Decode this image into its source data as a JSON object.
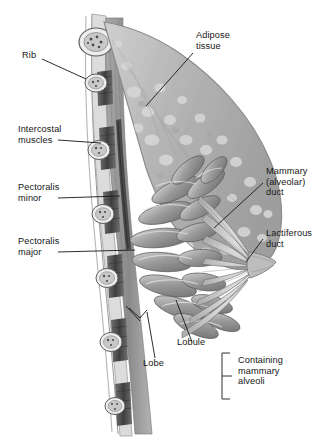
{
  "figure": {
    "type": "anatomical-illustration",
    "style": "grayscale medical line drawing",
    "width": 336,
    "height": 439,
    "background": "#ffffff"
  },
  "labels": [
    {
      "id": "rib",
      "text": "Rib",
      "x": 22,
      "y": 55,
      "leader": true
    },
    {
      "id": "adipose",
      "text": "Adipose\ntissue",
      "x": 196,
      "y": 36,
      "leader": true
    },
    {
      "id": "intercostal",
      "text": "Intercostal\nmuscles",
      "x": 18,
      "y": 124,
      "leader": true
    },
    {
      "id": "pect-minor",
      "text": "Pectoralis\nminor",
      "x": 18,
      "y": 182,
      "leader": true
    },
    {
      "id": "pect-major",
      "text": "Pectoralis\nmajor",
      "x": 18,
      "y": 236,
      "leader": true
    },
    {
      "id": "mammary-duct",
      "text": "Mammary\n(alveolar)\nduct",
      "x": 266,
      "y": 170,
      "leader": true
    },
    {
      "id": "lactiferous",
      "text": "Lactiferous\nduct",
      "x": 266,
      "y": 228,
      "leader": true
    },
    {
      "id": "lobe",
      "text": "Lobe",
      "x": 143,
      "y": 363,
      "leader": true
    },
    {
      "id": "lobule",
      "text": "Lobule",
      "x": 177,
      "y": 347,
      "leader": true
    },
    {
      "id": "alveoli",
      "text": "Containing\nmammary\nalveoli",
      "x": 238,
      "y": 357,
      "leader": false
    }
  ],
  "bracket": {
    "id": "alveoli-bracket",
    "orientation": "left",
    "x": 222,
    "y_top": 353,
    "y_bottom": 399
  },
  "colors": {
    "ink": "#161616",
    "leader_line": "#1a1a1a",
    "skin_outline": "#8c8c8c",
    "adipose_fill": "#b9b9b9",
    "adipose_blob": "#d6d6d6",
    "gland_fill": "#9a9a9a",
    "gland_shade": "#6e6e6e",
    "gland_high": "#d2d2d2",
    "muscle_dark": "#4a4a4a",
    "muscle_mid": "#7b7b7b",
    "rib_outline": "#6a6a6a",
    "rib_fill": "#e4e4e4",
    "marrow": "#5e5e5e",
    "duct_fill": "#cfcfcf",
    "background": "#ffffff"
  },
  "structures": [
    {
      "name": "rib",
      "count": 6,
      "description": "oval cross-sections with speckled marrow along chest wall"
    },
    {
      "name": "intercostal-muscle",
      "description": "dark striated bands between ribs"
    },
    {
      "name": "pectoralis-minor",
      "description": "thin dark muscle stripe deep to pectoralis major"
    },
    {
      "name": "pectoralis-major",
      "description": "broad muscle layer anterior to ribs"
    },
    {
      "name": "adipose-tissue",
      "description": "mottled light-gray fatty tissue filling the breast"
    },
    {
      "name": "mammary-lobule",
      "count": 12,
      "description": "elongated glandular lobes radiating toward the nipple"
    },
    {
      "name": "mammary-duct",
      "description": "ducts converging from lobules"
    },
    {
      "name": "lactiferous-duct",
      "description": "ducts opening at the nipple"
    },
    {
      "name": "nipple",
      "description": "apex of the breast where lactiferous ducts converge"
    },
    {
      "name": "suspensory-tissue",
      "description": "connective septa between lobules"
    }
  ]
}
